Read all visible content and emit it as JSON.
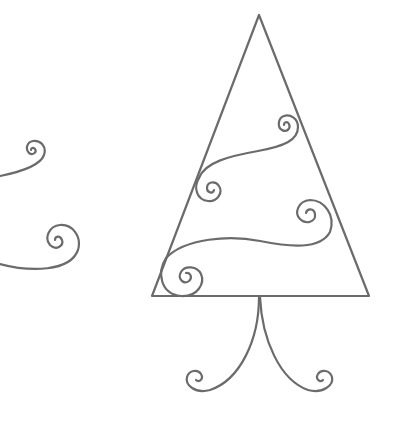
{
  "illustration": {
    "subject": "swirl christmas tree line drawing",
    "stroke_color": "#6b6b6b",
    "background": "#ffffff"
  }
}
